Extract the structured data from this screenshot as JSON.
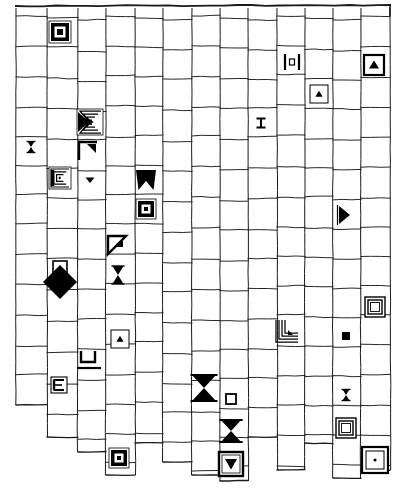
{
  "figure": {
    "width": 402,
    "height": 488,
    "background_color": "#ffffff",
    "line_color": "#1a1a1a",
    "ink_color": "#000000"
  },
  "grid": {
    "type": "ragged-rectangular-mesh",
    "column_count": 13,
    "column_x": [
      16,
      47,
      78,
      106,
      135,
      163,
      192,
      220,
      248,
      277,
      305,
      333,
      361,
      390
    ],
    "top_border_y": 6,
    "column_bottoms": [
      405,
      437,
      452,
      475,
      443,
      462,
      475,
      481,
      437,
      470,
      443,
      478,
      470
    ],
    "row_pitch": 30,
    "note": "horizontal rules are slightly wavy and do not align across all columns"
  },
  "symbols": [
    {
      "id": "s01",
      "name": "filled-square-in-box",
      "glyph": "boxed-square-solid",
      "col": 1,
      "row": 0,
      "x": 60,
      "y": 32,
      "size": 22
    },
    {
      "id": "s02",
      "name": "bracketed-square",
      "glyph": "bracket-square",
      "col": 8,
      "row": 1,
      "x": 292,
      "y": 62,
      "size": 16
    },
    {
      "id": "s03",
      "name": "up-triangle-in-box",
      "glyph": "boxed-triangle-up",
      "col": 11,
      "row": 1,
      "x": 374,
      "y": 65,
      "size": 20
    },
    {
      "id": "s04",
      "name": "small-up-triangle-in-box",
      "glyph": "boxed-triangle-up-thin",
      "col": 9,
      "row": 2,
      "x": 319,
      "y": 94,
      "size": 18
    },
    {
      "id": "s05",
      "name": "nested-sigma-triangle",
      "glyph": "nested-sigma",
      "col": 2,
      "row": 3,
      "x": 90,
      "y": 122,
      "size": 26
    },
    {
      "id": "s06",
      "name": "tiny-i-beam",
      "glyph": "i-beam-small",
      "col": 8,
      "row": 3,
      "x": 261,
      "y": 123,
      "size": 9
    },
    {
      "id": "s07",
      "name": "hourglass-mark",
      "glyph": "hourglass",
      "col": 0,
      "row": 4,
      "x": 31,
      "y": 147,
      "size": 11
    },
    {
      "id": "s08",
      "name": "corner-bracket-upper-left",
      "glyph": "corner-bracket-ul",
      "col": 2,
      "row": 4,
      "x": 88,
      "y": 151,
      "size": 18
    },
    {
      "id": "s09",
      "name": "nested-c-bracket",
      "glyph": "nested-c",
      "col": 1,
      "row": 5,
      "x": 60,
      "y": 178,
      "size": 22
    },
    {
      "id": "s10",
      "name": "small-down-triangle",
      "glyph": "triangle-down-small",
      "col": 2,
      "row": 5,
      "x": 90,
      "y": 180,
      "size": 10
    },
    {
      "id": "s11",
      "name": "crown-notch",
      "glyph": "crown-notch",
      "col": 4,
      "row": 5,
      "x": 146,
      "y": 180,
      "size": 20
    },
    {
      "id": "s12",
      "name": "filled-square-in-box-2",
      "glyph": "boxed-square-solid",
      "col": 4,
      "row": 6,
      "x": 146,
      "y": 209,
      "size": 20
    },
    {
      "id": "s13",
      "name": "right-triangle-solid",
      "glyph": "triangle-right",
      "col": 11,
      "row": 6,
      "x": 344,
      "y": 215,
      "size": 18
    },
    {
      "id": "s14",
      "name": "corner-wedge",
      "glyph": "corner-wedge",
      "col": 3,
      "row": 7,
      "x": 117,
      "y": 245,
      "size": 18
    },
    {
      "id": "s15",
      "name": "large-black-diamond",
      "glyph": "diamond-solid",
      "col": 1,
      "row": 8,
      "x": 60,
      "y": 280,
      "size": 34
    },
    {
      "id": "s16",
      "name": "hourglass-bold",
      "glyph": "hourglass",
      "col": 3,
      "row": 8,
      "x": 118,
      "y": 275,
      "size": 18
    },
    {
      "id": "s17",
      "name": "double-outline-square",
      "glyph": "double-square",
      "col": 12,
      "row": 9,
      "x": 375,
      "y": 307,
      "size": 20
    },
    {
      "id": "s18",
      "name": "nested-corner-arrow",
      "glyph": "nested-corner",
      "col": 9,
      "row": 10,
      "x": 287,
      "y": 331,
      "size": 22
    },
    {
      "id": "s19",
      "name": "tiny-filled-square",
      "glyph": "square-solid-small",
      "col": 11,
      "row": 10,
      "x": 346,
      "y": 336,
      "size": 8
    },
    {
      "id": "s20",
      "name": "small-triangle-in-box",
      "glyph": "boxed-triangle-up-thin",
      "col": 3,
      "row": 10,
      "x": 120,
      "y": 339,
      "size": 18
    },
    {
      "id": "s21",
      "name": "u-bracket",
      "glyph": "u-bracket",
      "col": 2,
      "row": 11,
      "x": 88,
      "y": 358,
      "size": 14
    },
    {
      "id": "s22",
      "name": "e-bracket",
      "glyph": "e-bracket",
      "col": 1,
      "row": 12,
      "x": 59,
      "y": 385,
      "size": 16
    },
    {
      "id": "s23",
      "name": "large-bowtie",
      "glyph": "bowtie-large",
      "col": 6,
      "row": 12,
      "x": 204,
      "y": 388,
      "size": 26
    },
    {
      "id": "s24",
      "name": "tiny-outline-square",
      "glyph": "square-outline-small",
      "col": 7,
      "row": 12,
      "x": 231,
      "y": 399,
      "size": 10
    },
    {
      "id": "s25",
      "name": "hourglass-right",
      "glyph": "hourglass",
      "col": 11,
      "row": 12,
      "x": 346,
      "y": 395,
      "size": 11
    },
    {
      "id": "s26",
      "name": "bowtie-mid",
      "glyph": "bowtie-large",
      "col": 7,
      "row": 13,
      "x": 231,
      "y": 431,
      "size": 22
    },
    {
      "id": "s27",
      "name": "double-square-right",
      "glyph": "double-square",
      "col": 11,
      "row": 13,
      "x": 346,
      "y": 428,
      "size": 20
    },
    {
      "id": "s28",
      "name": "filled-square-in-box-3",
      "glyph": "boxed-square-solid",
      "col": 3,
      "row": 14,
      "x": 119,
      "y": 458,
      "size": 20
    },
    {
      "id": "s29",
      "name": "down-triangle-in-box",
      "glyph": "boxed-triangle-down",
      "col": 7,
      "row": 14,
      "x": 231,
      "y": 464,
      "size": 24
    },
    {
      "id": "s30",
      "name": "dot-in-double-box",
      "glyph": "boxed-dot",
      "col": 12,
      "row": 14,
      "x": 375,
      "y": 460,
      "size": 26
    }
  ],
  "legend": {
    "glyph_names": [
      "boxed-square-solid",
      "bracket-square",
      "boxed-triangle-up",
      "boxed-triangle-up-thin",
      "nested-sigma",
      "i-beam-small",
      "hourglass",
      "corner-bracket-ul",
      "nested-c",
      "triangle-down-small",
      "crown-notch",
      "triangle-right",
      "corner-wedge",
      "diamond-solid",
      "double-square",
      "nested-corner",
      "square-solid-small",
      "u-bracket",
      "e-bracket",
      "bowtie-large",
      "square-outline-small",
      "boxed-triangle-down",
      "boxed-dot"
    ]
  }
}
